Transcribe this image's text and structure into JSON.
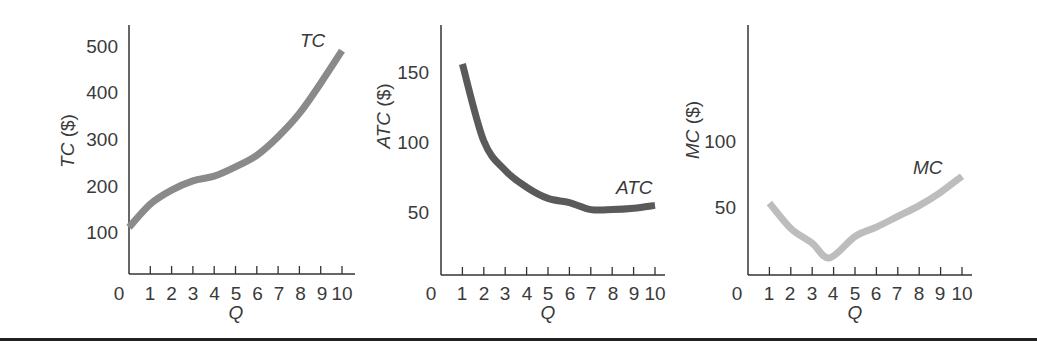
{
  "colors": {
    "axis": "#333333",
    "tc_curve": "#8a8a8a",
    "atc_curve": "#5a5a5a",
    "mc_curve": "#bdbdbd",
    "rule": "#222222"
  },
  "chart_data": [
    {
      "type": "line",
      "title": "",
      "xlabel": "Q",
      "ylabel": "TC ($)",
      "curve_label": "TC",
      "x": [
        0,
        1,
        2,
        3,
        4,
        5,
        6,
        7,
        8,
        9,
        10
      ],
      "x_tick_labels": [
        "0",
        "1",
        "2",
        "3",
        "4",
        "5",
        "6",
        "7",
        "8",
        "9",
        "10"
      ],
      "y_tick_labels": [
        "100",
        "200",
        "300",
        "400",
        "500"
      ],
      "series": [
        {
          "name": "TC",
          "values": [
            110,
            160,
            190,
            210,
            220,
            240,
            265,
            305,
            355,
            420,
            490
          ]
        }
      ],
      "ylim": [
        0,
        540
      ],
      "xlim": [
        0,
        10.5
      ],
      "grid": false,
      "legend": "inline label near curve end"
    },
    {
      "type": "line",
      "title": "",
      "xlabel": "Q",
      "ylabel": "ATC ($)",
      "curve_label": "ATC",
      "x": [
        1,
        2,
        3,
        4,
        5,
        6,
        7,
        8,
        9,
        10
      ],
      "x_tick_labels": [
        "0",
        "1",
        "2",
        "3",
        "4",
        "5",
        "6",
        "7",
        "8",
        "9",
        "10"
      ],
      "y_tick_labels": [
        "50",
        "100",
        "150"
      ],
      "series": [
        {
          "name": "ATC",
          "values": [
            155,
            100,
            79,
            67,
            59,
            56,
            51,
            51,
            52,
            54
          ]
        }
      ],
      "ylim": [
        0,
        180
      ],
      "xlim": [
        0,
        10.5
      ],
      "grid": false,
      "legend": "inline label near curve end"
    },
    {
      "type": "line",
      "title": "",
      "xlabel": "Q",
      "ylabel": "MC ($)",
      "curve_label": "MC",
      "x": [
        1,
        2,
        3,
        3.8,
        5,
        6,
        7,
        8,
        9,
        10
      ],
      "x_tick_labels": [
        "0",
        "1",
        "2",
        "3",
        "4",
        "5",
        "6",
        "7",
        "8",
        "9",
        "10"
      ],
      "y_tick_labels": [
        "50",
        "100"
      ],
      "series": [
        {
          "name": "MC",
          "values": [
            53,
            34,
            23,
            12,
            28,
            35,
            43,
            51,
            61,
            73
          ]
        }
      ],
      "ylim": [
        0,
        180
      ],
      "xlim": [
        0,
        10.5
      ],
      "grid": false,
      "legend": "inline label near curve end"
    }
  ],
  "panels": [
    {
      "ylabel_main": "TC",
      "ylabel_unit": " ($)",
      "curve_label": "TC",
      "xlabel": "Q",
      "yticks": [
        "500",
        "400",
        "300",
        "200",
        "100"
      ],
      "xticks": [
        "0",
        "1",
        "2",
        "3",
        "4",
        "5",
        "6",
        "7",
        "8",
        "9",
        "10"
      ]
    },
    {
      "ylabel_main": "ATC",
      "ylabel_unit": " ($)",
      "curve_label": "ATC",
      "xlabel": "Q",
      "yticks": [
        "150",
        "100",
        "50"
      ],
      "xticks": [
        "0",
        "1",
        "2",
        "3",
        "4",
        "5",
        "6",
        "7",
        "8",
        "9",
        "10"
      ]
    },
    {
      "ylabel_main": "MC",
      "ylabel_unit": " ($)",
      "curve_label": "MC",
      "xlabel": "Q",
      "yticks": [
        "100",
        "50"
      ],
      "xticks": [
        "0",
        "1",
        "2",
        "3",
        "4",
        "5",
        "6",
        "7",
        "8",
        "9",
        "10"
      ]
    }
  ]
}
